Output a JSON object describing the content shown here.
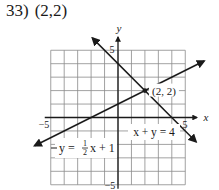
{
  "problem": {
    "number": "33)",
    "answer": "(2,2)"
  },
  "colors": {
    "grid": "#8a8a8a",
    "axis": "#1a1a1a",
    "line": "#1a1a1a",
    "background": "#ffffff"
  },
  "chart_data": {
    "type": "line",
    "title": "33) (2,2)",
    "xlabel": "x",
    "ylabel": "y",
    "xlim": [
      -5,
      5
    ],
    "ylim": [
      -5,
      5
    ],
    "grid": true,
    "tick_labels": {
      "x_min": "−5",
      "x_max": "5",
      "y_max": "5",
      "y_min": "−5"
    },
    "series": [
      {
        "name": "y = ½x + 1",
        "equation": "y = (1/2)x + 1",
        "slope": 0.5,
        "intercept": 1,
        "x": [
          -6.2,
          6.4
        ],
        "y": [
          -2.1,
          4.2
        ],
        "label_parts": {
          "lhs": "y =",
          "num": "1",
          "den": "2",
          "rhs": "x + 1"
        }
      },
      {
        "name": "x + y = 4",
        "equation": "x + y = 4",
        "slope": -1,
        "intercept": 4,
        "x": [
          -1.9,
          5.8
        ],
        "y": [
          5.9,
          -1.8
        ],
        "label": "x + y = 4"
      }
    ],
    "annotations": [
      {
        "text": "(2, 2)",
        "x": 2,
        "y": 2,
        "type": "intersection-point"
      }
    ]
  }
}
